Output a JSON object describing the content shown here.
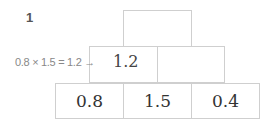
{
  "problem": {
    "number": "1",
    "pyramid": {
      "top": [
        ""
      ],
      "middle": [
        "",
        ""
      ],
      "bottom": [
        "0.8",
        "1.5",
        "0.4"
      ]
    },
    "annotation": {
      "expression": "0.8 × 1.5 = 1.2 →",
      "result": "1.2"
    }
  }
}
